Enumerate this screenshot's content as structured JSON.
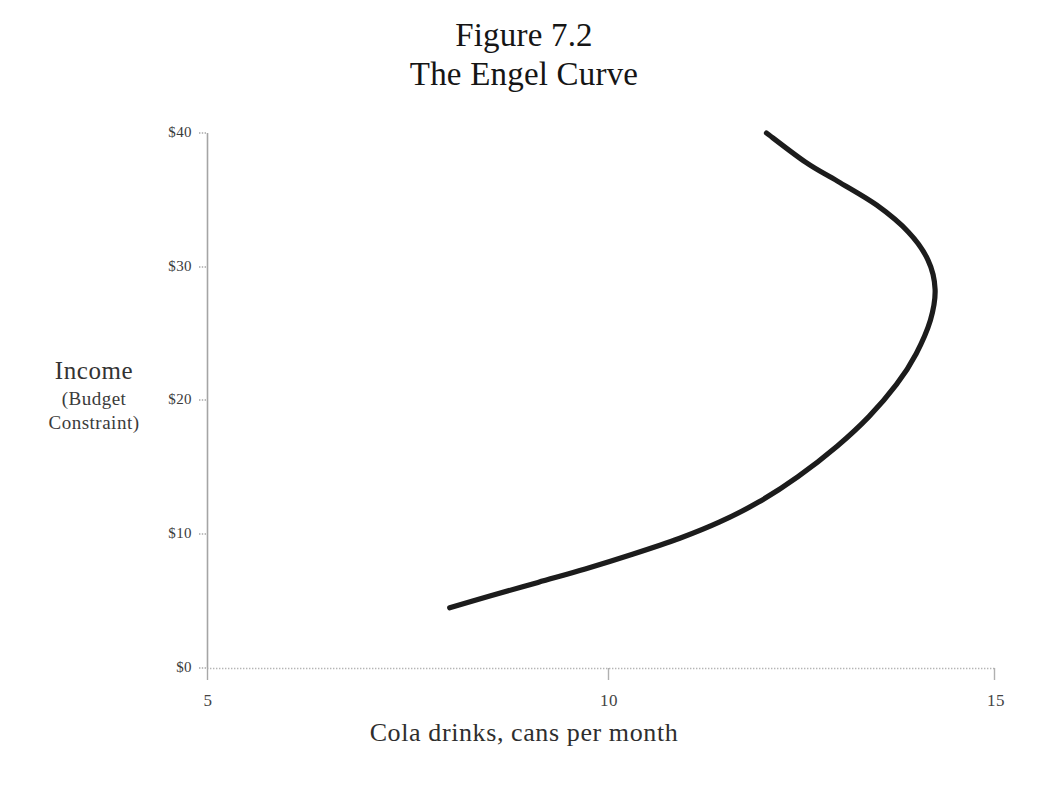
{
  "figure": {
    "title_line1": "Figure 7.2",
    "title_line2": "The Engel Curve"
  },
  "axes": {
    "y_title_main": "Income",
    "y_title_sub_line1": "(Budget",
    "y_title_sub_line2": "Constraint)",
    "x_title": "Cola drinks, cans per month"
  },
  "ticks": {
    "y": [
      "$40",
      "$30",
      "$20",
      "$10",
      "$0"
    ],
    "x": [
      "5",
      "10",
      "15"
    ]
  },
  "colors": {
    "curve": "#1c1c1c",
    "axis": "#9a9a9a",
    "gridline": "#bdbdbd",
    "text": "#1a1a1a",
    "background": "#ffffff"
  },
  "chart_data": {
    "type": "line",
    "xlabel": "Cola drinks, cans per month",
    "ylabel": "Income (Budget Constraint)",
    "xlim": [
      5,
      15
    ],
    "ylim": [
      0,
      40
    ],
    "xticks": [
      5,
      10,
      15
    ],
    "yticks": [
      0,
      10,
      20,
      30,
      40
    ],
    "ytick_labels": [
      "$0",
      "$10",
      "$20",
      "$30",
      "$40"
    ],
    "grid": false,
    "legend": null,
    "series": [
      {
        "name": "Engel curve",
        "comment": "Backward-bending: income rises with cola consumption up to about 14 cans at $28, then bends back as cola becomes an inferior good",
        "points": [
          {
            "x": 8.08,
            "y": 4.5
          },
          {
            "x": 8.6,
            "y": 5.4
          },
          {
            "x": 9.2,
            "y": 6.4
          },
          {
            "x": 9.8,
            "y": 7.4
          },
          {
            "x": 10.4,
            "y": 8.5
          },
          {
            "x": 11.0,
            "y": 9.7
          },
          {
            "x": 11.5,
            "y": 10.9
          },
          {
            "x": 12.0,
            "y": 12.4
          },
          {
            "x": 12.5,
            "y": 14.3
          },
          {
            "x": 13.0,
            "y": 16.6
          },
          {
            "x": 13.4,
            "y": 18.8
          },
          {
            "x": 13.75,
            "y": 21.2
          },
          {
            "x": 14.0,
            "y": 23.5
          },
          {
            "x": 14.18,
            "y": 26.0
          },
          {
            "x": 14.24,
            "y": 28.3
          },
          {
            "x": 14.15,
            "y": 30.5
          },
          {
            "x": 13.9,
            "y": 32.6
          },
          {
            "x": 13.5,
            "y": 34.6
          },
          {
            "x": 13.0,
            "y": 36.4
          },
          {
            "x": 12.6,
            "y": 37.8
          },
          {
            "x": 12.1,
            "y": 40.0
          }
        ]
      }
    ]
  },
  "plot_geometry": {
    "x_px_at_5": 207,
    "x_px_at_10": 608,
    "x_px_at_15": 995,
    "y_px_at_40": 133,
    "y_px_at_30": 267,
    "y_px_at_20": 400,
    "y_px_at_10": 534,
    "y_px_at_0": 668
  }
}
